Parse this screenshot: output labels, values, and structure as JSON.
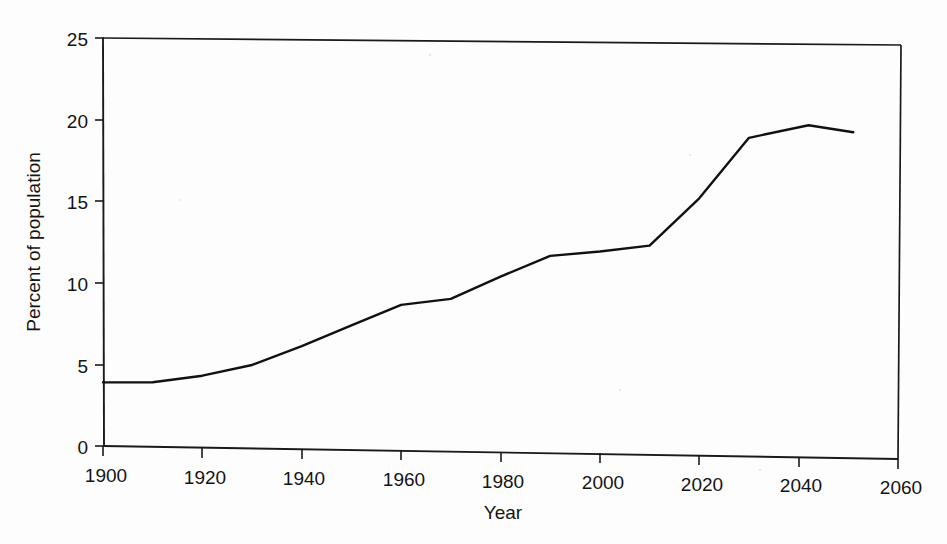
{
  "chart_data": {
    "type": "line",
    "title": "",
    "subtitle": "",
    "xlabel": "Year",
    "ylabel": "Percent of population",
    "xlim": [
      1900,
      2060
    ],
    "ylim": [
      0,
      25
    ],
    "xticks": [
      1900,
      1920,
      1940,
      1960,
      1980,
      2000,
      2020,
      2040,
      2060
    ],
    "yticks": [
      0,
      5,
      10,
      15,
      20,
      25
    ],
    "xtick_labels": [
      "1900",
      "1920",
      "1940",
      "1960",
      "1980",
      "2000",
      "2020",
      "2040",
      "2060"
    ],
    "ytick_labels": [
      "0",
      "5",
      "10",
      "15",
      "20",
      "25"
    ],
    "grid": false,
    "legend": false,
    "legend_position": "none",
    "line_color": "#111111",
    "series": [
      {
        "name": "Percent of population",
        "x": [
          1900,
          1910,
          1920,
          1930,
          1940,
          1950,
          1960,
          1970,
          1980,
          1990,
          2000,
          2010,
          2020,
          2030,
          2042,
          2051
        ],
        "values": [
          3.9,
          3.95,
          4.4,
          5.1,
          6.3,
          7.6,
          8.9,
          9.3,
          10.7,
          12.0,
          12.3,
          12.7,
          15.6,
          19.3,
          20.1,
          19.7
        ]
      }
    ]
  },
  "axes": {
    "y_axis_title": "Percent of population",
    "x_axis_title": "Year"
  }
}
